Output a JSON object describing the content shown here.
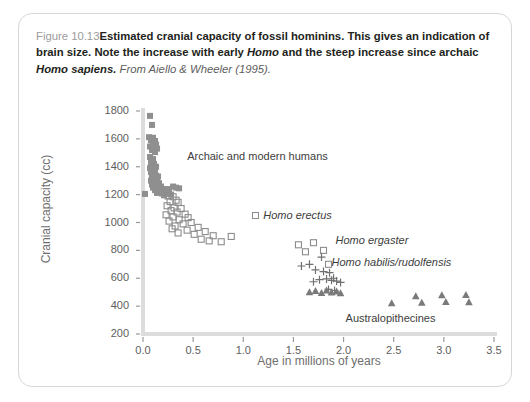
{
  "caption": {
    "figure_number": "Figure 10.13",
    "bold_text": "Estimated cranial capacity of fossil hominins. This gives an indication of brain size. Note the increase with early ",
    "bold_italic_1": "Homo",
    "bold_text_2": " and the steep increase since archaic ",
    "bold_italic_2": "Homo sapiens.",
    "source": " From Aiello & Wheeler (1995)."
  },
  "chart_data": {
    "type": "scatter",
    "title": "",
    "xlabel": "Age in millions of years",
    "ylabel": "Cranial capacity (cc)",
    "xlim": [
      0.0,
      3.5
    ],
    "ylim": [
      200,
      1800
    ],
    "xticks": [
      "0.0",
      "0.5",
      "1.0",
      "1.5",
      "2.0",
      "2.5",
      "3.0",
      "3.5"
    ],
    "yticks": [
      "200",
      "400",
      "600",
      "800",
      "1000",
      "1200",
      "1400",
      "1600",
      "1800"
    ],
    "grid": false,
    "legend_position": "inline-annotations",
    "annotations": [
      {
        "text": "Archaic and modern humans",
        "x": 0.44,
        "y": 1460,
        "italic": false,
        "marker": "none"
      },
      {
        "text": "Homo erectus",
        "x": 1.09,
        "y": 1040,
        "italic": true,
        "marker": "open-square"
      },
      {
        "text": "Homo ergaster",
        "x": 1.92,
        "y": 860,
        "italic": true,
        "marker": "none"
      },
      {
        "text": "Homo habilis/rudolfensis",
        "x": 1.88,
        "y": 700,
        "italic": true,
        "marker": "none"
      },
      {
        "text": "Australopithecines",
        "x": 2.02,
        "y": 300,
        "italic": false,
        "marker": "none"
      }
    ],
    "series": [
      {
        "name": "Archaic and modern humans",
        "marker": "filled-square",
        "color": "#8f8f8f",
        "points": [
          [
            0.07,
            1765
          ],
          [
            0.09,
            1700
          ],
          [
            0.06,
            1612
          ],
          [
            0.1,
            1608
          ],
          [
            0.08,
            1590
          ],
          [
            0.12,
            1585
          ],
          [
            0.1,
            1565
          ],
          [
            0.13,
            1558
          ],
          [
            0.07,
            1545
          ],
          [
            0.11,
            1540
          ],
          [
            0.14,
            1530
          ],
          [
            0.09,
            1520
          ],
          [
            0.12,
            1505
          ],
          [
            0.07,
            1470
          ],
          [
            0.1,
            1455
          ],
          [
            0.08,
            1430
          ],
          [
            0.11,
            1420
          ],
          [
            0.09,
            1408
          ],
          [
            0.13,
            1400
          ],
          [
            0.07,
            1390
          ],
          [
            0.1,
            1380
          ],
          [
            0.12,
            1372
          ],
          [
            0.08,
            1362
          ],
          [
            0.11,
            1352
          ],
          [
            0.09,
            1340
          ],
          [
            0.13,
            1335
          ],
          [
            0.15,
            1330
          ],
          [
            0.1,
            1320
          ],
          [
            0.12,
            1312
          ],
          [
            0.08,
            1300
          ],
          [
            0.14,
            1295
          ],
          [
            0.11,
            1288
          ],
          [
            0.16,
            1282
          ],
          [
            0.09,
            1272
          ],
          [
            0.13,
            1265
          ],
          [
            0.18,
            1258
          ],
          [
            0.1,
            1250
          ],
          [
            0.15,
            1245
          ],
          [
            0.2,
            1240
          ],
          [
            0.12,
            1232
          ],
          [
            0.17,
            1228
          ],
          [
            0.22,
            1222
          ],
          [
            0.26,
            1218
          ],
          [
            0.14,
            1212
          ],
          [
            0.19,
            1208
          ],
          [
            0.24,
            1205
          ],
          [
            0.3,
            1258
          ],
          [
            0.33,
            1250
          ],
          [
            0.02,
            1205
          ],
          [
            0.28,
            1200
          ],
          [
            0.21,
            1195
          ],
          [
            0.25,
            1240
          ],
          [
            0.36,
            1245
          ]
        ]
      },
      {
        "name": "Homo erectus",
        "marker": "open-square",
        "color": "#8c8c8c",
        "points": [
          [
            0.25,
            1190
          ],
          [
            0.3,
            1185
          ],
          [
            0.33,
            1160
          ],
          [
            0.27,
            1150
          ],
          [
            0.35,
            1145
          ],
          [
            0.24,
            1120
          ],
          [
            0.31,
            1105
          ],
          [
            0.38,
            1100
          ],
          [
            0.28,
            1085
          ],
          [
            0.34,
            1075
          ],
          [
            0.42,
            1060
          ],
          [
            0.23,
            1055
          ],
          [
            0.3,
            1040
          ],
          [
            0.45,
            1035
          ],
          [
            0.36,
            1020
          ],
          [
            0.26,
            1010
          ],
          [
            0.48,
            1000
          ],
          [
            0.4,
            990
          ],
          [
            0.32,
            975
          ],
          [
            0.55,
            965
          ],
          [
            0.29,
            955
          ],
          [
            0.44,
            945
          ],
          [
            0.62,
            935
          ],
          [
            0.35,
            925
          ],
          [
            0.51,
            915
          ],
          [
            0.7,
            905
          ],
          [
            0.88,
            900
          ],
          [
            0.58,
            880
          ],
          [
            0.66,
            868
          ],
          [
            0.78,
            862
          ],
          [
            1.55,
            840
          ],
          [
            1.7,
            855
          ],
          [
            1.8,
            800
          ],
          [
            1.62,
            790
          ],
          [
            1.85,
            700
          ]
        ]
      },
      {
        "name": "Homo habilis/rudolfensis",
        "marker": "plus",
        "color": "#707070",
        "points": [
          [
            1.78,
            752
          ],
          [
            1.66,
            700
          ],
          [
            1.58,
            688
          ],
          [
            1.72,
            660
          ],
          [
            1.8,
            648
          ],
          [
            1.86,
            640
          ],
          [
            1.9,
            600
          ],
          [
            1.83,
            595
          ],
          [
            1.76,
            590
          ],
          [
            1.88,
            585
          ],
          [
            1.93,
            580
          ],
          [
            1.7,
            575
          ],
          [
            1.97,
            570
          ],
          [
            1.85,
            520
          ],
          [
            1.91,
            512
          ]
        ]
      },
      {
        "name": "Australopithecines",
        "marker": "filled-triangle",
        "color": "#7a7a7a",
        "points": [
          [
            1.66,
            500
          ],
          [
            1.72,
            508
          ],
          [
            1.78,
            495
          ],
          [
            1.83,
            512
          ],
          [
            1.88,
            498
          ],
          [
            1.93,
            505
          ],
          [
            1.97,
            492
          ],
          [
            2.48,
            420
          ],
          [
            2.72,
            470
          ],
          [
            2.78,
            425
          ],
          [
            2.98,
            478
          ],
          [
            3.02,
            430
          ],
          [
            3.22,
            480
          ],
          [
            3.25,
            428
          ]
        ]
      }
    ]
  }
}
